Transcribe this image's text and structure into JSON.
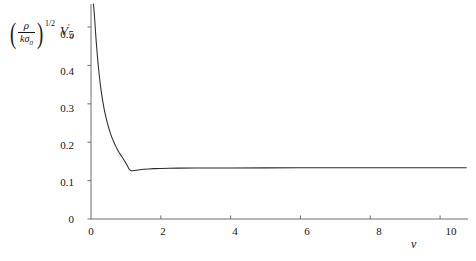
{
  "chart_data": {
    "type": "line",
    "title": "",
    "xlabel": "v",
    "ylabel_parts": {
      "open_paren": "(",
      "numerator": "ρ",
      "denominator": "kσ",
      "denominator_sub": "0",
      "close_paren": ")",
      "exponent": "1/2",
      "factor": "V",
      "factor_sub": "0",
      "factor_sup": "′"
    },
    "ylabel_text": "(ρ/kσ₀)^(1/2) V₀′",
    "xlim": [
      0,
      10.8
    ],
    "ylim": [
      0,
      0.56
    ],
    "xticks": [
      0,
      2,
      4,
      6,
      8,
      10
    ],
    "xtick_labels": [
      "0",
      "2",
      "4",
      "6",
      "8",
      "10"
    ],
    "yticks": [
      0,
      0.1,
      0.2,
      0.3,
      0.4,
      0.5
    ],
    "ytick_labels": [
      "0",
      "0.1",
      "0.2",
      "0.3",
      "0.4",
      "0.5"
    ],
    "grid": false,
    "legend": null,
    "line_color": "#2b2b2b",
    "axis_color": "#6e6e6e",
    "x": [
      0.07,
      0.09,
      0.11,
      0.13,
      0.15,
      0.18,
      0.21,
      0.24,
      0.27,
      0.3,
      0.34,
      0.38,
      0.42,
      0.46,
      0.5,
      0.55,
      0.6,
      0.65,
      0.7,
      0.75,
      0.8,
      0.85,
      0.9,
      0.95,
      1.0,
      1.03,
      1.06,
      1.1,
      1.15,
      1.2,
      1.3,
      1.4,
      1.5,
      1.65,
      1.8,
      2.0,
      2.25,
      2.5,
      3.0,
      3.5,
      4.0,
      5.0,
      6.0,
      7.0,
      8.0,
      9.0,
      10.0,
      10.75
    ],
    "y": [
      0.56,
      0.54,
      0.515,
      0.487,
      0.462,
      0.428,
      0.398,
      0.371,
      0.348,
      0.328,
      0.305,
      0.285,
      0.268,
      0.253,
      0.24,
      0.225,
      0.212,
      0.201,
      0.191,
      0.182,
      0.174,
      0.167,
      0.16,
      0.153,
      0.1455,
      0.1405,
      0.1355,
      0.1285,
      0.1255,
      0.1255,
      0.1272,
      0.1285,
      0.1295,
      0.1305,
      0.1312,
      0.1318,
      0.1322,
      0.1325,
      0.1328,
      0.133,
      0.1331,
      0.1332,
      0.1333,
      0.1333,
      0.1334,
      0.1334,
      0.1334,
      0.1334
    ],
    "annotations": {
      "minimum_x": 1.12,
      "minimum_y": 0.1252,
      "asymptote_y": 0.1334
    }
  },
  "plot_box": {
    "left": 91,
    "right": 468,
    "top": 4,
    "bottom": 219
  }
}
